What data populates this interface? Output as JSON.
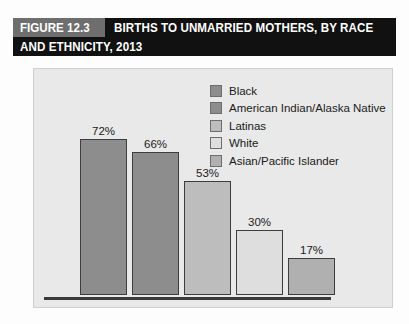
{
  "banner": {
    "figure_tag": "FIGURE 12.3",
    "title_line_1": "BIRTHS TO UNMARRIED MOTHERS, BY RACE",
    "title_line_2": "AND ETHNICITY, 2013",
    "tag_background": "#6e6e6e",
    "background": "#111111",
    "text_color": "#ffffff"
  },
  "panel": {
    "background": "#e9e9e9",
    "border_color": "#cfcfcf",
    "axis_color": "#3a3a3a"
  },
  "legend": {
    "position": "top-right",
    "items": [
      {
        "label": "Black",
        "color": "#8d8d8d"
      },
      {
        "label": "American Indian/Alaska Native",
        "color": "#8d8d8d"
      },
      {
        "label": "Latinas",
        "color": "#bdbdbd"
      },
      {
        "label": "White",
        "color": "#dedede"
      },
      {
        "label": "Asian/Pacific Islander",
        "color": "#b0b0b0"
      }
    ]
  },
  "chart_data": {
    "type": "bar",
    "title": "BIRTHS TO UNMARRIED MOTHERS, BY RACE AND ETHNICITY, 2013",
    "subtitle": "",
    "xlabel": "",
    "ylabel": "",
    "ylim": [
      0,
      80
    ],
    "grid": false,
    "legend_position": "top-right",
    "categories": [
      "Black",
      "American Indian/Alaska Native",
      "Latinas",
      "White",
      "Asian/Pacific Islander"
    ],
    "values": [
      72,
      66,
      53,
      30,
      17
    ],
    "value_labels": [
      "72%",
      "66%",
      "53%",
      "30%",
      "17%"
    ],
    "colors": [
      "#8d8d8d",
      "#8d8d8d",
      "#bdbdbd",
      "#dedede",
      "#b0b0b0"
    ],
    "bar_border_color": "#3d3d3d"
  }
}
